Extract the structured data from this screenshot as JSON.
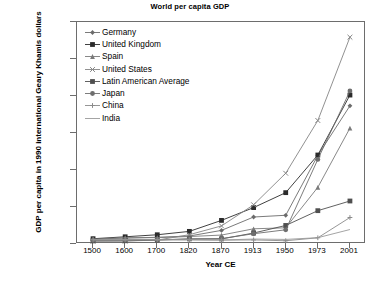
{
  "chart_data": {
    "type": "line",
    "title": "World per capita GDP",
    "xlabel": "Year CE",
    "ylabel": "GDP per capita in 1990 international Geary Khamis dollars",
    "categories": [
      "1500",
      "1600",
      "1700",
      "1820",
      "1870",
      "1913",
      "1950",
      "1973",
      "2001"
    ],
    "x_tick_labels": [
      "1500",
      "1600",
      "1700",
      "1820",
      "1870",
      "1913",
      "1950",
      "1973",
      "2001"
    ],
    "y_tick_labels": [
      "0",
      "5000",
      "10000",
      "15000",
      "20000",
      "25000",
      "30000"
    ],
    "ylim": [
      0,
      30000
    ],
    "y_tick_interval": 5000,
    "grid": false,
    "legend_position": "top-left-inside",
    "series": [
      {
        "name": "Germany",
        "marker": "diamond",
        "color": "#6b6b6b",
        "values": [
          688,
          791,
          910,
          1077,
          1839,
          3648,
          3881,
          11966,
          18677
        ]
      },
      {
        "name": "United Kingdom",
        "marker": "square",
        "color": "#2b2b2b",
        "values": [
          714,
          974,
          1250,
          1706,
          3190,
          4921,
          6939,
          12025,
          20127
        ]
      },
      {
        "name": "Spain",
        "marker": "triangle",
        "color": "#7a7a7a",
        "values": [
          661,
          853,
          853,
          1008,
          1207,
          2056,
          2189,
          7661,
          15659
        ]
      },
      {
        "name": "United States",
        "marker": "x",
        "color": "#858585",
        "values": [
          400,
          400,
          527,
          1257,
          2445,
          5301,
          9561,
          16689,
          27948
        ]
      },
      {
        "name": "Latin American Average",
        "marker": "square",
        "color": "#4f4f4f",
        "values": [
          416,
          438,
          527,
          692,
          681,
          1481,
          2506,
          4504,
          5811
        ]
      },
      {
        "name": "Japan",
        "marker": "circle",
        "color": "#6e6e6e",
        "values": [
          500,
          520,
          570,
          669,
          737,
          1387,
          1921,
          11434,
          20683
        ]
      },
      {
        "name": "China",
        "marker": "plus",
        "color": "#8a8a8a",
        "values": [
          600,
          600,
          600,
          600,
          530,
          552,
          439,
          839,
          3583
        ]
      },
      {
        "name": "India",
        "marker": "line",
        "color": "#9a9a9a",
        "values": [
          550,
          550,
          550,
          533,
          533,
          673,
          619,
          853,
          1957
        ]
      }
    ]
  },
  "caption": ""
}
